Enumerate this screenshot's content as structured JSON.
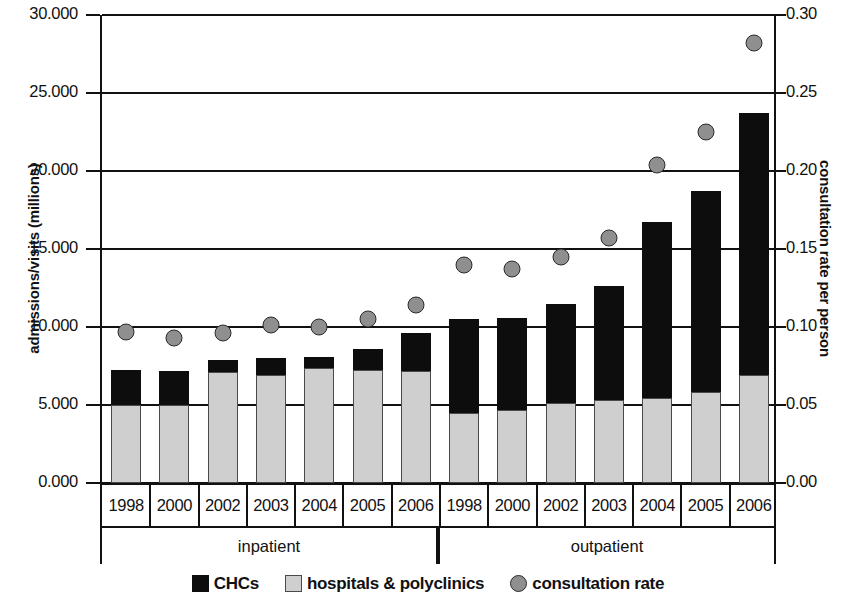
{
  "chart_data": {
    "type": "bar",
    "title": "",
    "xlabel": "",
    "ylabel": "admissions/visits (millions)",
    "y2label": "consultation rate per person",
    "ylim": [
      0,
      30
    ],
    "y2lim": [
      0,
      0.3
    ],
    "ytick_labels": [
      "30.000",
      "25.000",
      "20.000",
      "15.000",
      "10.000",
      "5.000",
      "0.000"
    ],
    "ytick_values": [
      30,
      25,
      20,
      15,
      10,
      5,
      0
    ],
    "y2tick_labels": [
      "0.30",
      "0.25",
      "0.20",
      "0.15",
      "0.10",
      "0.05",
      "0.00"
    ],
    "y2tick_values": [
      0.3,
      0.25,
      0.2,
      0.15,
      0.1,
      0.05,
      0.0
    ],
    "grid": true,
    "legend_position": "bottom",
    "group_labels": [
      "inpatient",
      "outpatient"
    ],
    "categories": [
      "1998",
      "2000",
      "2002",
      "2003",
      "2004",
      "2005",
      "2006",
      "1998",
      "2000",
      "2002",
      "2003",
      "2004",
      "2005",
      "2006"
    ],
    "series": [
      {
        "name": "hospitals & polyclinics",
        "color": "#cfcfcf",
        "axis": "left",
        "values": [
          5.0,
          5.0,
          7.1,
          6.95,
          7.35,
          7.25,
          7.15,
          4.5,
          4.7,
          5.1,
          5.3,
          5.45,
          5.85,
          6.9
        ]
      },
      {
        "name": "CHCs",
        "color": "#0d0d0d",
        "axis": "left",
        "values": [
          2.25,
          2.2,
          0.8,
          1.05,
          0.75,
          1.35,
          2.45,
          6.0,
          5.85,
          6.4,
          7.3,
          11.25,
          12.85,
          16.8
        ]
      },
      {
        "name": "consultation rate",
        "color": "#8f8f8f",
        "axis": "right",
        "marker": "circle",
        "values": [
          0.097,
          0.093,
          0.096,
          0.101,
          0.1,
          0.105,
          0.114,
          0.14,
          0.137,
          0.145,
          0.157,
          0.204,
          0.225,
          0.282
        ]
      }
    ],
    "totals": [
      7.25,
      7.2,
      7.9,
      8.0,
      8.1,
      8.6,
      9.6,
      10.5,
      10.55,
      11.5,
      12.6,
      16.7,
      18.7,
      23.7
    ],
    "legend": [
      "CHCs",
      "hospitals & polyclinics",
      "consultation rate"
    ]
  }
}
